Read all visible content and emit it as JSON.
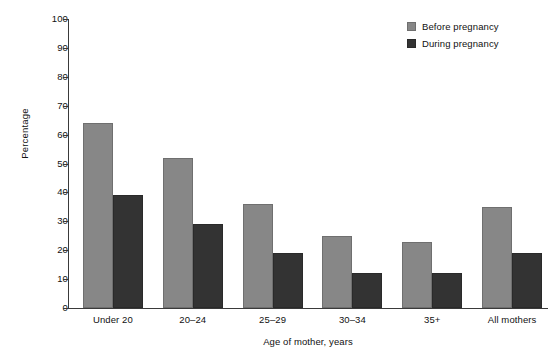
{
  "chart_data": {
    "type": "bar",
    "title": "",
    "xlabel": "Age of mother, years",
    "ylabel": "Percentage",
    "categories": [
      "Under 20",
      "20–24",
      "25–29",
      "30–34",
      "35+",
      "All mothers"
    ],
    "series": [
      {
        "name": "Before pregnancy",
        "color": "#878787",
        "values": [
          64,
          52,
          36,
          25,
          23,
          35
        ]
      },
      {
        "name": "During pregnancy",
        "color": "#333333",
        "values": [
          39,
          29,
          19,
          12,
          12,
          19
        ]
      }
    ],
    "ylim": [
      0,
      100
    ],
    "ytick_step": 10,
    "yticks": [
      0,
      10,
      20,
      30,
      40,
      50,
      60,
      70,
      80,
      90,
      100
    ],
    "ytick_labels": [
      "0",
      "10",
      "20",
      "30",
      "40",
      "50",
      "60",
      "70",
      "80",
      "90",
      "100"
    ],
    "grid": false,
    "legend_position": "top-right"
  },
  "legend": {
    "entries": [
      {
        "label": "Before pregnancy",
        "swatch": "legend-swatch-before-pregnancy"
      },
      {
        "label": "During pregnancy",
        "swatch": "legend-swatch-during-pregnancy"
      }
    ]
  }
}
